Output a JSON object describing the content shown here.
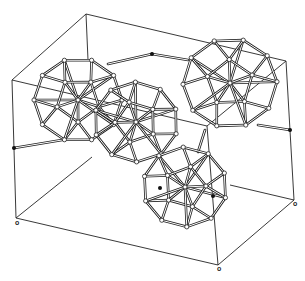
{
  "diagram": {
    "type": "crystal-structure-unit-cell",
    "colors": {
      "line": "#222222",
      "bg": "#ffffff",
      "node_fill": "#ffffff",
      "dot": "#111111"
    },
    "cell_edges": [
      [
        [
          86,
          14
        ],
        [
          286,
          61
        ]
      ],
      [
        [
          86,
          14
        ],
        [
          12,
          80
        ]
      ],
      [
        [
          12,
          80
        ],
        [
          16,
          218
        ]
      ],
      [
        [
          16,
          218
        ],
        [
          218,
          265
        ]
      ],
      [
        [
          218,
          265
        ],
        [
          294,
          200
        ]
      ],
      [
        [
          294,
          200
        ],
        [
          286,
          61
        ]
      ],
      [
        [
          12,
          80
        ],
        [
          207,
          126
        ]
      ],
      [
        [
          286,
          61
        ],
        [
          207,
          126
        ]
      ],
      [
        [
          207,
          126
        ],
        [
          218,
          265
        ]
      ],
      [
        [
          86,
          14
        ],
        [
          88,
          60
        ]
      ],
      [
        [
          16,
          218
        ],
        [
          92,
          157
        ]
      ],
      [
        [
          230,
          185
        ],
        [
          294,
          200
        ]
      ]
    ],
    "clusters": [
      {
        "cx": 78,
        "cy": 100,
        "r": 44
      },
      {
        "cx": 136,
        "cy": 122,
        "r": 42
      },
      {
        "cx": 230,
        "cy": 83,
        "r": 47
      },
      {
        "cx": 185,
        "cy": 187,
        "r": 42
      }
    ],
    "links": [
      [
        [
          108,
          64
        ],
        [
          152,
          54
        ]
      ],
      [
        [
          152,
          54
        ],
        [
          188,
          60
        ]
      ],
      [
        [
          14,
          148
        ],
        [
          62,
          140
        ]
      ],
      [
        [
          258,
          125
        ],
        [
          290,
          130
        ]
      ],
      [
        [
          205,
          130
        ],
        [
          198,
          152
        ]
      ]
    ],
    "dots": [
      [
        152,
        54
      ],
      [
        14,
        148
      ],
      [
        290,
        130
      ],
      [
        160,
        188
      ],
      [
        213,
        196
      ]
    ],
    "labels": [
      {
        "text": "o",
        "x": 16,
        "y": 221
      },
      {
        "text": "o",
        "x": 218,
        "y": 267
      },
      {
        "text": "o",
        "x": 294,
        "y": 202
      }
    ]
  }
}
